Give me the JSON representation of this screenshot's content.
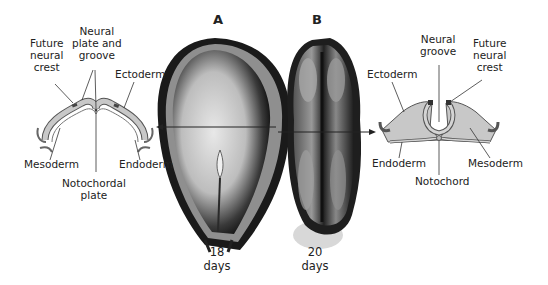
{
  "panels": {
    "a": {
      "letter": "A",
      "age_number": "18",
      "age_unit": "days"
    },
    "b": {
      "letter": "B",
      "age_number": "20",
      "age_unit": "days"
    }
  },
  "left_cross_section": {
    "labels": {
      "future_neural_crest": [
        "Future",
        "neural",
        "crest"
      ],
      "neural_plate_and_groove": [
        "Neural",
        "plate and",
        "groove"
      ],
      "ectoderm": "Ectoderm",
      "mesoderm": "Mesoderm",
      "endoderm": "Endoderm",
      "notochordal_plate": [
        "Notochordal",
        "plate"
      ]
    }
  },
  "right_cross_section": {
    "labels": {
      "neural_groove": [
        "Neural",
        "groove"
      ],
      "future_neural_crest": [
        "Future",
        "neural",
        "crest"
      ],
      "ectoderm": "Ectoderm",
      "endoderm": "Endoderm",
      "mesoderm": "Mesoderm",
      "notochord": "Notochord"
    }
  },
  "colors": {
    "tissue_fill": "#c8c8c8",
    "outline": "#555555",
    "crest_dark": "#444444",
    "embryo_dark": "#1a1a1a",
    "embryo_light": "#d9d9d9"
  }
}
